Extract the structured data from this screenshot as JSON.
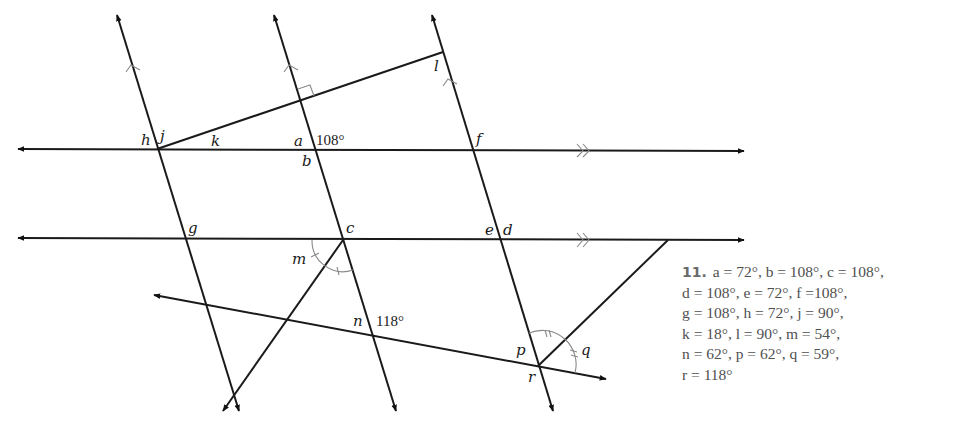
{
  "diagram": {
    "angle_labels": {
      "a": "a",
      "b": "b",
      "c": "c",
      "d": "d",
      "e": "e",
      "f": "f",
      "g": "g",
      "h": "h",
      "j": "j",
      "k": "k",
      "l": "l",
      "m": "m",
      "n": "n",
      "p": "p",
      "q": "q",
      "r": "r"
    },
    "given_angles": {
      "upper": "108°",
      "lower": "118°"
    },
    "markings": {
      "parallel_single_arrow_lines": 3,
      "parallel_double_arrow_lines": 2,
      "right_angle_marker": "square at intersection of line 2 and top segment",
      "equal_angle_single_tick": "m",
      "equal_angle_double_tick": "p/q"
    }
  },
  "answer": {
    "number": "11.",
    "lines": [
      "a = 72°, b = 108°, c = 108°,",
      "d = 108°, e = 72°, f =108°,",
      "g = 108°, h = 72°, j = 90°,",
      "k = 18°, l = 90°, m = 54°,",
      "n = 62°, p = 62°, q = 59°,",
      "r = 118°"
    ],
    "values": {
      "a": "72°",
      "b": "108°",
      "c": "108°",
      "d": "108°",
      "e": "72°",
      "f": "108°",
      "g": "108°",
      "h": "72°",
      "j": "90°",
      "k": "18°",
      "l": "90°",
      "m": "54°",
      "n": "62°",
      "p": "62°",
      "q": "59°",
      "r": "118°"
    }
  }
}
